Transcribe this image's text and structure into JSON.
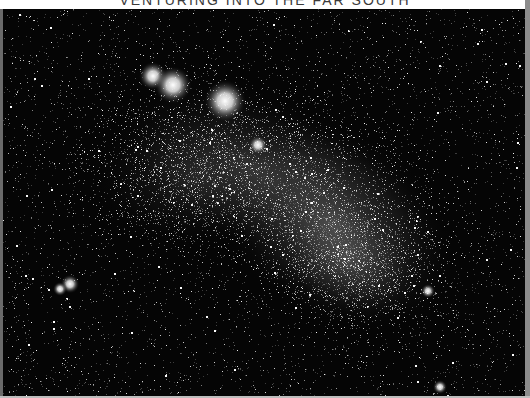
{
  "caption": {
    "text": "VENTURING INTO THE FAR SOUTH",
    "color": "#3a3a3a"
  },
  "photo": {
    "subject": "Small Magellanic Cloud star field",
    "background_color": "#050505",
    "galaxy_glow": [
      {
        "cx": 330,
        "cy": 215,
        "rx": 135,
        "ry": 95,
        "rot": 35,
        "alpha": 0.34
      },
      {
        "cx": 250,
        "cy": 160,
        "rx": 150,
        "ry": 80,
        "rot": 20,
        "alpha": 0.2
      },
      {
        "cx": 190,
        "cy": 170,
        "rx": 110,
        "ry": 70,
        "rot": 0,
        "alpha": 0.12
      },
      {
        "cx": 345,
        "cy": 250,
        "rx": 80,
        "ry": 55,
        "rot": 30,
        "alpha": 0.22
      }
    ],
    "clusters": [
      {
        "name": "cluster-ngc362",
        "x": 150,
        "y": 67,
        "r": 6
      },
      {
        "name": "cluster-47tuc-halo-a",
        "x": 170,
        "y": 76,
        "r": 8
      },
      {
        "name": "cluster-47tuc-halo-b",
        "x": 222,
        "y": 92,
        "r": 9
      },
      {
        "name": "bright-star",
        "x": 255,
        "y": 136,
        "r": 4
      },
      {
        "name": "cluster-lower-left",
        "x": 67,
        "y": 275,
        "r": 4
      },
      {
        "name": "cluster-lower-left-b",
        "x": 57,
        "y": 280,
        "r": 3
      },
      {
        "name": "bright-star-right",
        "x": 425,
        "y": 282,
        "r": 3
      },
      {
        "name": "bright-star-bottom",
        "x": 437,
        "y": 378,
        "r": 3
      }
    ],
    "star_counts": {
      "field": 5200,
      "galaxy": 14000
    }
  }
}
